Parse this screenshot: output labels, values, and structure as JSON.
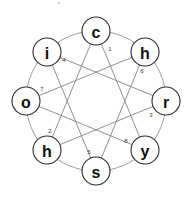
{
  "diagram": {
    "title": "",
    "type": "circular-graph",
    "background_color": "#ffffff",
    "node_fill": "#ffffff",
    "node_stroke": "#2b2b2b",
    "ring_color": "#8d8d8d",
    "chord_color": "#7d7d7d",
    "center": {
      "x": 96,
      "y": 101
    },
    "ring_radius": 70,
    "node_radius": 14,
    "nodes": [
      {
        "label": "c",
        "index": "1",
        "angle_deg": 270,
        "cx": 96,
        "cy": 31,
        "ix": 110,
        "iy": 49
      },
      {
        "label": "h",
        "index": "6",
        "angle_deg": 315,
        "cx": 145,
        "cy": 52,
        "ix": 142,
        "iy": 71
      },
      {
        "label": "r",
        "index": "3",
        "angle_deg": 0,
        "cx": 166,
        "cy": 101,
        "ix": 151,
        "iy": 115
      },
      {
        "label": "y",
        "index": "8",
        "angle_deg": 45,
        "cx": 145,
        "cy": 150,
        "ix": 126,
        "iy": 141
      },
      {
        "label": "s",
        "index": "5",
        "angle_deg": 90,
        "cx": 96,
        "cy": 171,
        "ix": 89,
        "iy": 152
      },
      {
        "label": "h",
        "index": "2",
        "angle_deg": 135,
        "cx": 47,
        "cy": 150,
        "ix": 50,
        "iy": 131
      },
      {
        "label": "o",
        "index": "7",
        "angle_deg": 180,
        "cx": 26,
        "cy": 101,
        "ix": 42,
        "iy": 89
      },
      {
        "label": "i",
        "index": "4",
        "angle_deg": 225,
        "cx": 47,
        "cy": 52,
        "ix": 64,
        "iy": 60
      }
    ],
    "ring_edges": [
      {
        "from": 0,
        "to": 1
      },
      {
        "from": 1,
        "to": 2
      },
      {
        "from": 2,
        "to": 3
      },
      {
        "from": 3,
        "to": 4
      },
      {
        "from": 4,
        "to": 5
      },
      {
        "from": 5,
        "to": 6
      },
      {
        "from": 6,
        "to": 7
      },
      {
        "from": 7,
        "to": 0
      }
    ],
    "chords": [
      {
        "from": 0,
        "to": 3
      },
      {
        "from": 1,
        "to": 4
      },
      {
        "from": 2,
        "to": 5
      },
      {
        "from": 3,
        "to": 6
      },
      {
        "from": 4,
        "to": 7
      },
      {
        "from": 5,
        "to": 0
      },
      {
        "from": 6,
        "to": 1
      },
      {
        "from": 7,
        "to": 2
      }
    ],
    "word": "chrysohi"
  }
}
